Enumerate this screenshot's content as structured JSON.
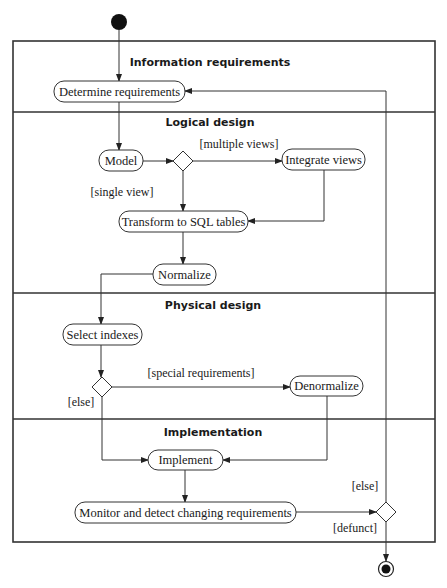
{
  "lanes": [
    {
      "title": "Information requirements"
    },
    {
      "title": "Logical design"
    },
    {
      "title": "Physical design"
    },
    {
      "title": "Implementation"
    }
  ],
  "activities": {
    "determine": "Determine requirements",
    "model": "Model",
    "integrate": "Integrate views",
    "transform": "Transform to SQL tables",
    "normalize": "Normalize",
    "select_indexes": "Select indexes",
    "denormalize": "Denormalize",
    "implement": "Implement",
    "monitor": "Monitor and detect changing requirements"
  },
  "guards": {
    "multiple_views": "[multiple views]",
    "single_view": "[single view]",
    "special_requirements": "[special requirements]",
    "physical_else": "[else]",
    "loop_else": "[else]",
    "defunct": "[defunct]"
  },
  "colors": {
    "stroke": "#333333",
    "text": "#1a1a1a",
    "background": "#ffffff"
  }
}
